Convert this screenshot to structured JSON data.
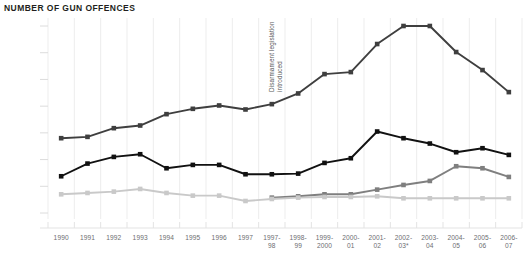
{
  "chart_data": {
    "type": "line",
    "title": "NUMBER OF GUN OFFENCES",
    "xlabel": "",
    "ylabel": "",
    "ylim": [
      0,
      14000
    ],
    "yticks": [
      0,
      2000,
      4000,
      6000,
      8000,
      10000,
      12000,
      14000
    ],
    "ytick_labels": [
      "0",
      "2,000",
      "4,000",
      "6,000",
      "8,000",
      "10,000",
      "12,000",
      "14,000"
    ],
    "grid": "vertical",
    "legend": "none",
    "categories": [
      "1990",
      "1991",
      "1992",
      "1993",
      "1994",
      "1995",
      "1996",
      "1997",
      "1997-\n98",
      "1998-\n99",
      "1999-\n2000",
      "2000-\n01",
      "2001-\n02",
      "2002-\n03*",
      "2003-\n04",
      "2004-\n05",
      "2005-\n06",
      "2006-\n07"
    ],
    "annotations": [
      {
        "text": "Disarmament legislation\nintroduced",
        "category": "1997-\n98",
        "rotation": -90
      }
    ],
    "series": [
      {
        "name": "total-gun-offences",
        "color": "#3f3f3f",
        "marker": "square",
        "values": [
          5600,
          5700,
          6350,
          6550,
          7400,
          7800,
          8050,
          7750,
          8150,
          8950,
          10400,
          10550,
          12650,
          14000,
          14000,
          12050,
          10700,
          9050
        ]
      },
      {
        "name": "gun-offences-series-two",
        "color": "#111111",
        "marker": "square",
        "values": [
          2750,
          3700,
          4200,
          4400,
          3350,
          3600,
          3600,
          2900,
          2900,
          2950,
          3750,
          4100,
          6100,
          5600,
          5200,
          4550,
          4850,
          4350
        ]
      },
      {
        "name": "gun-offences-series-three",
        "color": "#7f7f7f",
        "marker": "square",
        "values": [
          null,
          null,
          null,
          null,
          null,
          null,
          null,
          null,
          1150,
          1250,
          1400,
          1400,
          1750,
          2100,
          2400,
          3500,
          3350,
          2700
        ]
      },
      {
        "name": "gun-offences-series-four",
        "color": "#c9c9c9",
        "marker": "square",
        "values": [
          1400,
          1500,
          1600,
          1800,
          1500,
          1300,
          1300,
          900,
          1050,
          1150,
          1200,
          1200,
          1250,
          1100,
          1100,
          1100,
          1100,
          1100
        ]
      }
    ]
  }
}
